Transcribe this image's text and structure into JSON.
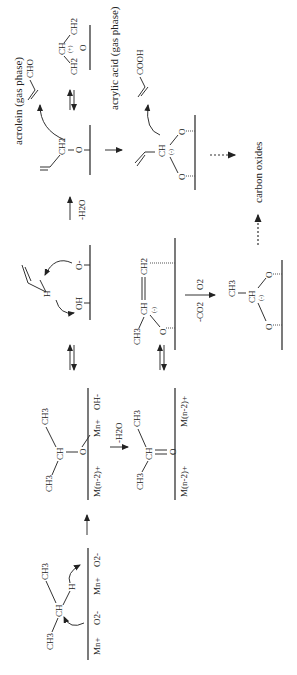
{
  "diagram": {
    "type": "reaction-mechanism",
    "orientation": "rotated-90-ccw",
    "species": {
      "propane_adsorption": {
        "surface_sites": [
          "Mn+",
          "O2-",
          "Mn+",
          "O2-"
        ],
        "groups": [
          "CH3",
          "CH",
          "CH3",
          "H"
        ]
      },
      "isopropoxide": {
        "surface_sites": [
          "M(n-2)+",
          "Mn+",
          "OH-"
        ],
        "groups": [
          "CH3",
          "CH",
          "CH3",
          "O"
        ]
      },
      "acetone_like": {
        "surface_sites": [
          "M(n-2)+",
          "M(n-2)+"
        ],
        "groups": [
          "CH3",
          "CH",
          "CH3",
          "O"
        ]
      },
      "allyl_h_abstraction": {
        "surface_sites": [
          "OH",
          "O-"
        ],
        "groups": [
          "H"
        ]
      },
      "allyloxy": {
        "groups": [
          "CH2",
          "O"
        ]
      },
      "allyl_cation": {
        "groups": [
          "CH",
          "CH2",
          "CH2",
          "O"
        ],
        "charge": "(+)"
      },
      "propenyl_bidentate": {
        "groups": [
          "CH3",
          "CH",
          "CH2",
          "O"
        ],
        "charge": "(-)"
      },
      "acrylate": {
        "groups": [
          "CH",
          "O",
          "O"
        ],
        "charge": "(-)"
      },
      "acetate_like": {
        "groups": [
          "CH3",
          "CH",
          "O",
          "O"
        ],
        "charge": "(-)"
      }
    },
    "step_labels": {
      "dehydration_1": "-H2O",
      "dehydration_2": "-H2O",
      "oxidation_o2": "O2",
      "oxidation_co2": "-CO2"
    },
    "products": {
      "acrolein": "acrolein (gas phase)",
      "acrolein_formula": "CHO",
      "acrylic_acid": "acrylic acid (gas phase)",
      "acrylic_acid_formula": "COOH",
      "carbon_oxides": "carbon oxides"
    },
    "labels": {
      "mn": "Mn+",
      "o2": "O2-",
      "m_reduced": "M(n-2)+",
      "oh_minus": "OH-",
      "oh": "OH",
      "o_minus": "O-",
      "ch3": "CH3",
      "ch": "CH",
      "ch2": "CH2",
      "h": "H",
      "o": "O",
      "plus": "(+)",
      "minus": "(-)"
    }
  }
}
